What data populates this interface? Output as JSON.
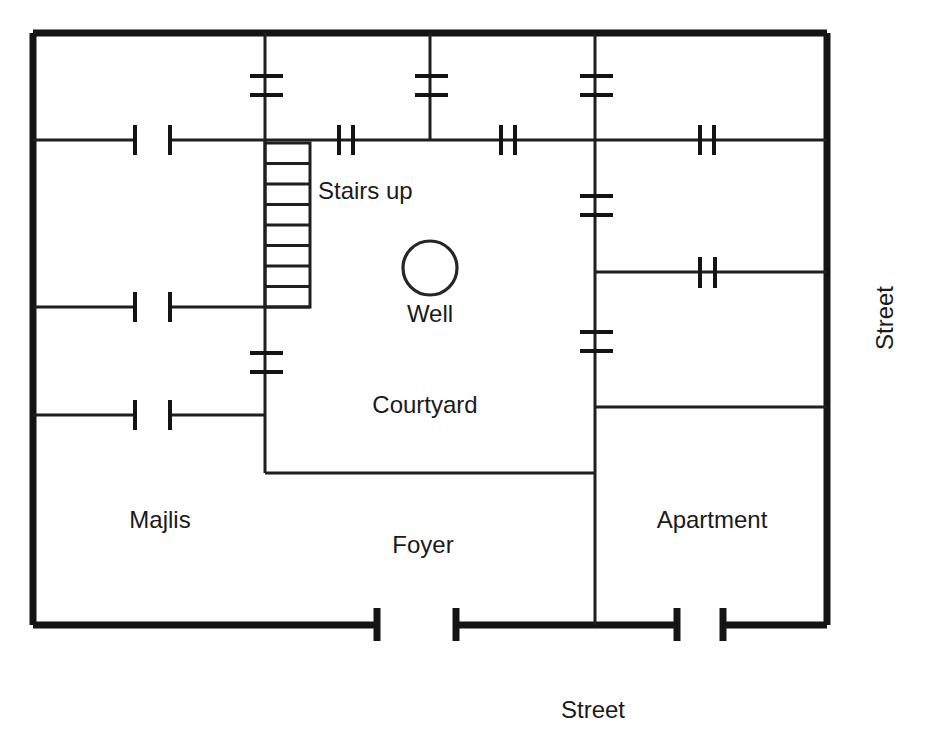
{
  "diagram": {
    "kind": "architectural-floor-plan",
    "background_color": "#ffffff",
    "line_color": "#141414"
  },
  "labels": {
    "stairs": "Stairs up",
    "well": "Well",
    "courtyard": "Courtyard",
    "majlis": "Majlis",
    "foyer": "Foyer",
    "apartment": "Apartment",
    "street_bottom": "Street",
    "street_right": "Street"
  },
  "label_positions": {
    "stairs": {
      "x": 318,
      "y": 199,
      "anchor": "start"
    },
    "well": {
      "x": 430,
      "y": 322,
      "anchor": "middle"
    },
    "courtyard": {
      "x": 425,
      "y": 413,
      "anchor": "middle"
    },
    "majlis": {
      "x": 160,
      "y": 528,
      "anchor": "middle"
    },
    "foyer": {
      "x": 423,
      "y": 553,
      "anchor": "middle"
    },
    "apartment": {
      "x": 712,
      "y": 528,
      "anchor": "middle"
    },
    "street_bottom": {
      "x": 593,
      "y": 718,
      "anchor": "middle"
    },
    "street_right": {
      "x": 893,
      "y": 318,
      "anchor": "middle",
      "rotated": true
    }
  },
  "geometry": {
    "outer_wall": {
      "left": 33,
      "top": 33,
      "right": 827,
      "bottom": 625
    },
    "well": {
      "cx": 430,
      "cy": 268,
      "r": 27
    },
    "stairs": {
      "x1": 265,
      "x2": 310,
      "y_top": 143,
      "y_bottom": 307,
      "treads": 8
    }
  },
  "rooms": [
    {
      "name": "Majlis",
      "note": "left range, three sub-rooms with doors"
    },
    {
      "name": "Courtyard",
      "note": "central open court with well"
    },
    {
      "name": "Foyer",
      "note": "entrance hall along bottom"
    },
    {
      "name": "Apartment",
      "note": "right range"
    }
  ],
  "symbols": {
    "door_opening": "pair of jamb ticks across a wall line",
    "window": "double cross tick on a wall line",
    "stair": "ladder of treads with direction label",
    "well": "circle"
  }
}
